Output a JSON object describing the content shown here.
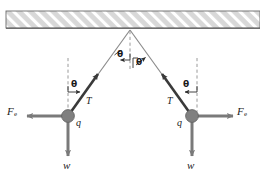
{
  "figure": {
    "ceiling": {
      "name": "hatched ceiling support",
      "fill": "#d4d4d4",
      "hatch_color": "#ffffff",
      "border_color": "#4d4d4d"
    },
    "colors": {
      "string": "#8a8a8a",
      "sphere": "#808080",
      "sphere_edge": "#5a5a5a",
      "arrow": "#7a7a7a",
      "tension_arrow": "#333333",
      "dashed": "#9a9a9a",
      "text": "#222222"
    },
    "labels": {
      "theta_apex_left": "θ",
      "theta_apex_right": "θ",
      "theta_left": "θ",
      "theta_right": "θ",
      "tension_left": "T",
      "tension_right": "T",
      "charge_left": "q",
      "charge_right": "q",
      "weight_left": "w",
      "weight_right": "w",
      "force_left_symbol": "F",
      "force_left_subscript": "e",
      "force_right_symbol": "F",
      "force_right_subscript": "e"
    }
  }
}
